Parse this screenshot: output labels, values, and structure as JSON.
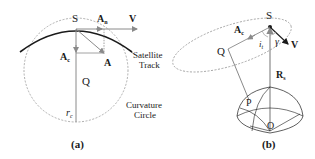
{
  "panel_a": {
    "caption": "(a)",
    "labels": {
      "S": "S",
      "An_main": "A",
      "An_sub": "n",
      "V": "V",
      "Ac_main": "A",
      "Ac_sub": "c",
      "A": "A",
      "Q": "Q",
      "rc_main": "r",
      "rc_sub": "c",
      "track_line1": "Satellite",
      "track_line2": "Track",
      "circle_line1": "Curvature",
      "circle_line2": "Circle"
    }
  },
  "panel_b": {
    "caption": "(b)",
    "labels": {
      "S": "S",
      "Ac_main": "A",
      "Ac_sub": "c",
      "Q": "Q",
      "it_main": "i",
      "it_sub": "t",
      "gamma": "γ",
      "V": "V",
      "Rs_main": "R",
      "Rs_sub": "s",
      "P": "P",
      "O": "O"
    }
  },
  "colors": {
    "ink": "#1a1a1a",
    "gray": "#8a8a8a",
    "dashed": "#9a9a9a"
  }
}
